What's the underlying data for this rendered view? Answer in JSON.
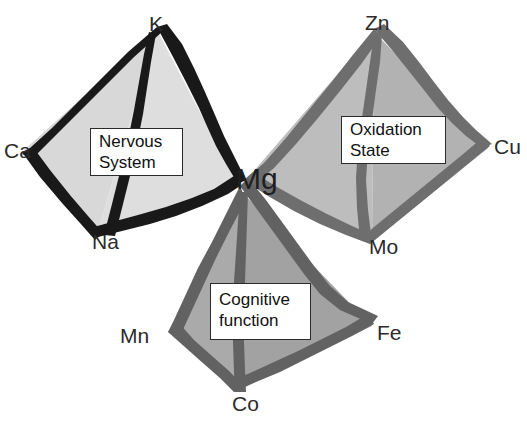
{
  "figure": {
    "shared_center_label": "Mg",
    "cropped_top_title": "",
    "colors": {
      "background": "#ffffff",
      "pyramid_nervous_edge": "#1a1a1a",
      "pyramid_nervous_fill": "#dcdcdc",
      "pyramid_nervous_fill_dark": "#c9c9c9",
      "pyramid_oxidation_edge": "#707070",
      "pyramid_oxidation_fill": "#b8b8b8",
      "pyramid_oxidation_fill_dark": "#a6a6a6",
      "pyramid_cognitive_edge": "#636363",
      "pyramid_cognitive_fill": "#a8a8a8",
      "pyramid_cognitive_fill_dark": "#9a9a9a",
      "label_text": "#2b2b2b",
      "caption_text": "#111111",
      "caption_border": "#2a2a2a"
    },
    "pyramids": [
      {
        "id": "nervous-system",
        "caption_lines": [
          "Nervous",
          "System"
        ],
        "caption_text": "Nervous System",
        "vertices": [
          {
            "name": "K",
            "role": "apex",
            "x": 157,
            "y": 25
          },
          {
            "name": "Ca",
            "role": "left",
            "x": 18,
            "y": 152
          },
          {
            "name": "Na",
            "role": "front",
            "x": 92,
            "y": 243
          },
          {
            "name": "Mg",
            "role": "right",
            "x": 240,
            "y": 183
          }
        ]
      },
      {
        "id": "oxidation-state",
        "caption_lines": [
          "Oxidation",
          "State"
        ],
        "caption_text": "Oxidation State",
        "vertices": [
          {
            "name": "Zn",
            "role": "apex",
            "x": 374,
            "y": 25
          },
          {
            "name": "Mg",
            "role": "left",
            "x": 240,
            "y": 183
          },
          {
            "name": "Mo",
            "role": "front",
            "x": 371,
            "y": 248
          },
          {
            "name": "Cu",
            "role": "right",
            "x": 494,
            "y": 148
          }
        ]
      },
      {
        "id": "cognitive-function",
        "caption_lines": [
          "Cognitive",
          "function"
        ],
        "caption_text": "Cognitive function",
        "vertices": [
          {
            "name": "Mg",
            "role": "apex",
            "x": 240,
            "y": 183
          },
          {
            "name": "Mn",
            "role": "left",
            "x": 122,
            "y": 328
          },
          {
            "name": "Co",
            "role": "front",
            "x": 233,
            "y": 397
          },
          {
            "name": "Fe",
            "role": "right",
            "x": 378,
            "y": 323
          }
        ]
      }
    ],
    "labels": [
      {
        "name": "K",
        "text": "K",
        "x": 149,
        "y": 13
      },
      {
        "name": "Ca",
        "text": "Ca",
        "x": 4,
        "y": 140
      },
      {
        "name": "Na",
        "text": "Na",
        "x": 92,
        "y": 231
      },
      {
        "name": "Zn",
        "text": "Zn",
        "x": 365,
        "y": 12
      },
      {
        "name": "Cu",
        "text": "Cu",
        "x": 494,
        "y": 136
      },
      {
        "name": "Mo",
        "text": "Mo",
        "x": 369,
        "y": 236
      },
      {
        "name": "Mn",
        "text": "Mn",
        "x": 120,
        "y": 325
      },
      {
        "name": "Fe",
        "text": "Fe",
        "x": 377,
        "y": 322
      },
      {
        "name": "Co",
        "text": "Co",
        "x": 232,
        "y": 393
      },
      {
        "name": "Mg",
        "text": "Mg",
        "x": 236,
        "y": 164
      }
    ],
    "caption_boxes": [
      {
        "id": "nervous-system",
        "x": 90,
        "y": 128,
        "w": 93,
        "h": 48
      },
      {
        "id": "oxidation-state",
        "x": 341,
        "y": 116,
        "w": 105,
        "h": 48
      },
      {
        "id": "cognitive-function",
        "x": 210,
        "y": 283,
        "w": 101,
        "h": 57
      }
    ]
  }
}
